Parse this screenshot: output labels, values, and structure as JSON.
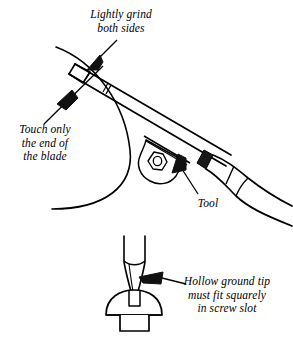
{
  "figure": {
    "ink_color": "#000000",
    "background_color": "#ffffff",
    "line_style": "pen-and-ink line art"
  },
  "labels": {
    "lightly_grind": {
      "lines": [
        "Lightly grind",
        "both sides"
      ],
      "text": "Lightly grind both sides",
      "align": "center",
      "points_to": "blade-bevel-upper"
    },
    "touch_only": {
      "lines": [
        "Touch only",
        "the end of",
        "the blade"
      ],
      "text": "Touch only the end of the blade",
      "align": "center",
      "points_to": "blade-bevel-lower"
    },
    "tool": {
      "lines": [
        "Tool"
      ],
      "text": "Tool",
      "align": "center",
      "points_to": "tool-ferrule"
    },
    "hollow_ground": {
      "lines": [
        "Hollow ground tip",
        "must fit squarely",
        "in screw slot"
      ],
      "text": "Hollow ground tip must fit squarely in screw slot",
      "align": "center",
      "points_to": "hollow-ground-tip-edge"
    }
  },
  "parts": {
    "grinding_wheel": "grinding-wheel-arc",
    "screwdriver_blade": "screwdriver-blade",
    "tool_rest": "tool-rest-bracket",
    "hex_nut": "hex-nut",
    "ferrule": "blade-ferrule",
    "handle": "screwdriver-handle",
    "detail_tip": "hollow-ground-tip-detail",
    "screw": "slotted-round-head-screw"
  }
}
